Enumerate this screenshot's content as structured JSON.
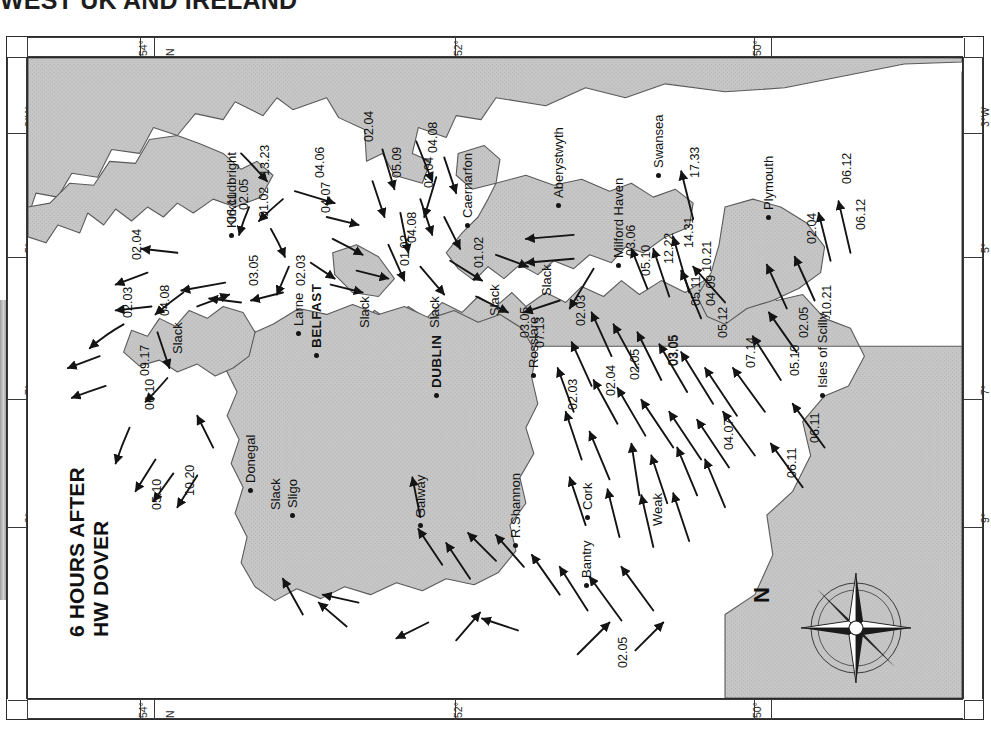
{
  "header": {
    "title": "WEST UK AND IRELAND"
  },
  "chart": {
    "title_line1": "6 HOURS AFTER",
    "title_line2": "HW DOVER",
    "compass_label": "N",
    "land_color": "#c6c6c6",
    "sea_color": "#ffffff",
    "ink_color": "#141414"
  },
  "graticule": {
    "latitude_labels": [
      "54°",
      "52°",
      "50°"
    ],
    "latitude_north_marker": "N",
    "longitude_labels": [
      "3°W",
      "5°",
      "7°",
      "9°"
    ]
  },
  "places": [
    {
      "name": "Kirkcudbright",
      "x": 196,
      "y": 170
    },
    {
      "name": "Caernarfon",
      "x": 432,
      "y": 160
    },
    {
      "name": "Aberystwyth",
      "x": 523,
      "y": 140
    },
    {
      "name": "Swansea",
      "x": 623,
      "y": 110
    },
    {
      "name": "Milford Haven",
      "x": 583,
      "y": 200
    },
    {
      "name": "Plymouth",
      "x": 733,
      "y": 152
    },
    {
      "name": "Larne",
      "x": 263,
      "y": 268
    },
    {
      "name": "BELFAST",
      "x": 281,
      "y": 290
    },
    {
      "name": "DUBLIN",
      "x": 401,
      "y": 330
    },
    {
      "name": "Rosslare",
      "x": 498,
      "y": 310
    },
    {
      "name": "Donegal",
      "x": 215,
      "y": 425
    },
    {
      "name": "Sligo",
      "x": 257,
      "y": 450
    },
    {
      "name": "Galway",
      "x": 385,
      "y": 460
    },
    {
      "name": "R.Shannon",
      "x": 480,
      "y": 480
    },
    {
      "name": "Cork",
      "x": 552,
      "y": 452
    },
    {
      "name": "Bantry",
      "x": 551,
      "y": 520
    },
    {
      "name": "Isles of Scilly",
      "x": 787,
      "y": 330
    }
  ],
  "rates": [
    {
      "value": "13.23",
      "x": 230,
      "y": 118
    },
    {
      "value": "02.05",
      "x": 209,
      "y": 152
    },
    {
      "value": "06.11",
      "x": 197,
      "y": 165
    },
    {
      "value": "01.02",
      "x": 229,
      "y": 160
    },
    {
      "value": "04.06",
      "x": 285,
      "y": 120
    },
    {
      "value": "04.07",
      "x": 291,
      "y": 155
    },
    {
      "value": "02.04",
      "x": 334,
      "y": 84
    },
    {
      "value": "05.09",
      "x": 362,
      "y": 120
    },
    {
      "value": "04.08",
      "x": 398,
      "y": 95
    },
    {
      "value": "02.04",
      "x": 394,
      "y": 130
    },
    {
      "value": "04.08",
      "x": 377,
      "y": 185
    },
    {
      "value": "01.02",
      "x": 444,
      "y": 210
    },
    {
      "value": "01.02",
      "x": 370,
      "y": 208
    },
    {
      "value": "02.04",
      "x": 102,
      "y": 202
    },
    {
      "value": "03.05",
      "x": 219,
      "y": 228
    },
    {
      "value": "02.03",
      "x": 266,
      "y": 228
    },
    {
      "value": "02.03",
      "x": 93,
      "y": 260
    },
    {
      "value": "04.08",
      "x": 130,
      "y": 258
    },
    {
      "value": "09.17",
      "x": 110,
      "y": 318
    },
    {
      "value": "06.10",
      "x": 115,
      "y": 352
    },
    {
      "value": "05.10",
      "x": 122,
      "y": 452
    },
    {
      "value": "10.20",
      "x": 155,
      "y": 438
    },
    {
      "value": "03.05",
      "x": 490,
      "y": 280
    },
    {
      "value": "07.13",
      "x": 505,
      "y": 290
    },
    {
      "value": "02.03",
      "x": 546,
      "y": 268
    },
    {
      "value": "02.03",
      "x": 538,
      "y": 352
    },
    {
      "value": "02.04",
      "x": 576,
      "y": 338
    },
    {
      "value": "02.05",
      "x": 600,
      "y": 322
    },
    {
      "value": "03.05",
      "x": 638,
      "y": 308
    },
    {
      "value": "05.12",
      "x": 688,
      "y": 280
    },
    {
      "value": "04.09",
      "x": 676,
      "y": 248
    },
    {
      "value": "04.07",
      "x": 694,
      "y": 392
    },
    {
      "value": "03.06",
      "x": 596,
      "y": 198
    },
    {
      "value": "05.10",
      "x": 611,
      "y": 218
    },
    {
      "value": "12.22",
      "x": 634,
      "y": 206
    },
    {
      "value": "14.31",
      "x": 654,
      "y": 190
    },
    {
      "value": "17.33",
      "x": 660,
      "y": 120
    },
    {
      "value": "05.11",
      "x": 661,
      "y": 248
    },
    {
      "value": "10.21",
      "x": 672,
      "y": 214
    },
    {
      "value": "03.05",
      "x": 639,
      "y": 308
    },
    {
      "value": "07.14",
      "x": 716,
      "y": 310
    },
    {
      "value": "05.10",
      "x": 760,
      "y": 318
    },
    {
      "value": "02.05",
      "x": 769,
      "y": 280
    },
    {
      "value": "10.21",
      "x": 792,
      "y": 258
    },
    {
      "value": "02.04",
      "x": 777,
      "y": 186
    },
    {
      "value": "06.12",
      "x": 812,
      "y": 126
    },
    {
      "value": "06.12",
      "x": 826,
      "y": 172
    },
    {
      "value": "06.11",
      "x": 780,
      "y": 385
    },
    {
      "value": "06.11",
      "x": 757,
      "y": 420
    },
    {
      "value": "02.05",
      "x": 588,
      "y": 610
    }
  ],
  "slack_labels": [
    {
      "text": "Slack",
      "x": 329,
      "y": 270
    },
    {
      "text": "Slack",
      "x": 399,
      "y": 270
    },
    {
      "text": "Slack",
      "x": 459,
      "y": 258
    },
    {
      "text": "Slack",
      "x": 511,
      "y": 238
    },
    {
      "text": "Slack",
      "x": 142,
      "y": 296
    },
    {
      "text": "Slack",
      "x": 240,
      "y": 452
    }
  ],
  "other_labels": [
    {
      "text": "Weak",
      "x": 622,
      "y": 468
    }
  ]
}
